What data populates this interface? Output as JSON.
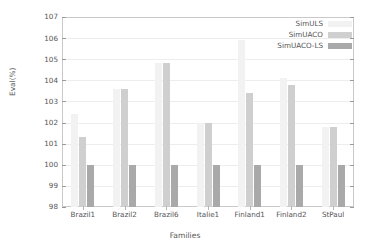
{
  "chart_data": {
    "type": "bar",
    "title": "",
    "xlabel": "Families",
    "ylabel": "Eval(%)",
    "categories": [
      "Brazil1",
      "Brazil2",
      "Brazil6",
      "Italie1",
      "Finland1",
      "Finland2",
      "StPaul"
    ],
    "ylim": [
      98,
      107
    ],
    "yticks": [
      98,
      99,
      100,
      101,
      102,
      103,
      104,
      105,
      106,
      107
    ],
    "ytick_labels": [
      "98",
      "99",
      "100",
      "101",
      "102",
      "103",
      "104",
      "105",
      "106",
      "107"
    ],
    "grid": true,
    "legend_position": "top-right",
    "series": [
      {
        "name": "SimULS",
        "color": "#f2f2f2",
        "values": [
          102.4,
          103.6,
          104.8,
          102.0,
          105.9,
          104.1,
          101.8
        ]
      },
      {
        "name": "SimUACO",
        "color": "#cfcfcf",
        "values": [
          101.3,
          103.6,
          104.8,
          102.0,
          103.4,
          103.8,
          101.8
        ]
      },
      {
        "name": "SimUACO-LS",
        "color": "#a9a9a9",
        "values": [
          100.0,
          100.0,
          100.0,
          100.0,
          100.0,
          100.0,
          100.0
        ]
      }
    ]
  }
}
